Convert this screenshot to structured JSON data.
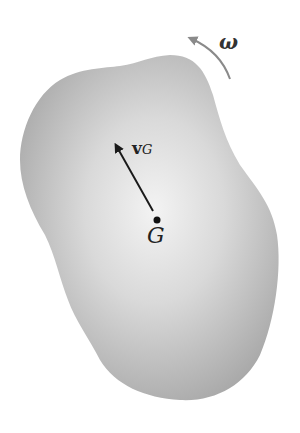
{
  "diagram": {
    "type": "rigid-body-kinematics",
    "body": {
      "fill_center": "#f2f2f2",
      "fill_edge": "#a9a9a9"
    },
    "center_of_mass": {
      "label": "G"
    },
    "velocity_vector": {
      "symbol": "v",
      "subscript": "G"
    },
    "angular_velocity": {
      "symbol": "ω",
      "arrow_color": "#8a8a8a",
      "direction": "counterclockwise"
    }
  }
}
